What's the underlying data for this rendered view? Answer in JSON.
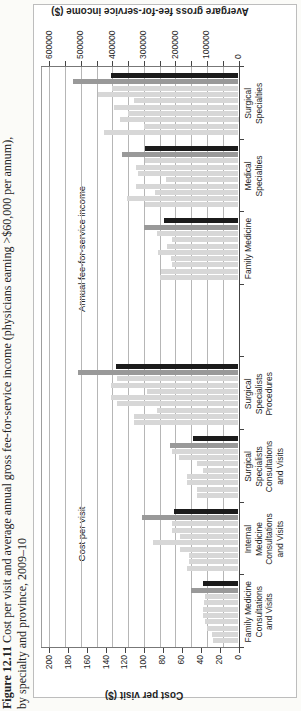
{
  "caption": {
    "figure_label": "Figure 12.11",
    "line1": "Cost per visit and average annual gross fee-for-service income (physicians earning >$60,000 per annum),",
    "line2": "by specialty and province, 2009–10"
  },
  "chart_data": {
    "type": "bar",
    "title": "",
    "rotation_note": "figure printed sideways: entire chart rotated 90° counter-clockwise on the portrait page",
    "left_axis": {
      "title": "Cost per visit ($)",
      "min": 0,
      "max": 200,
      "tick_step": 20,
      "tick_labels": [
        "0",
        "20",
        "40",
        "60",
        "80",
        "100",
        "120",
        "140",
        "160",
        "180",
        "200"
      ]
    },
    "right_axis": {
      "title": "Avergare gross fee-for-service income ($)",
      "min": 0,
      "max": 600000,
      "tick_step": 100000,
      "minor_tick_step": 50000,
      "tick_labels": [
        "0",
        "100000",
        "200000",
        "300000",
        "400000",
        "500000",
        "600000"
      ]
    },
    "section_labels": {
      "cost": "Cost per visit",
      "income": "Annual fee-for-service income"
    },
    "bar_colors": {
      "light": "#d7d7d7",
      "gray": "#999999",
      "black": "#1b1b1b"
    },
    "legend": "none (10 unlabeled province bars per specialty: 8 light gray, 1 medium gray, 1 black)",
    "grid": "horizontal gridlines every 50000 on income axis, spanning full plot",
    "groups": [
      {
        "category_lines": [
          "Family Medicine",
          "Consultations",
          "and Visits"
        ],
        "axis": "left",
        "values": [
          27,
          28,
          33,
          35,
          38,
          38,
          36,
          35,
          50,
          38
        ],
        "colors": [
          "light",
          "light",
          "light",
          "light",
          "light",
          "light",
          "light",
          "light",
          "gray",
          "black"
        ]
      },
      {
        "category_lines": [
          "Internal",
          "Medicine",
          "Consultations",
          "and Visits"
        ],
        "axis": "left",
        "values": [
          54,
          52,
          52,
          62,
          90,
          62,
          70,
          70,
          102,
          68
        ],
        "colors": [
          "light",
          "light",
          "light",
          "light",
          "light",
          "light",
          "light",
          "light",
          "gray",
          "black"
        ]
      },
      {
        "category_lines": [
          "Surgical",
          "Specialists",
          "Consultations",
          "and Visits"
        ],
        "axis": "left",
        "values": [
          44,
          44,
          54,
          54,
          38,
          44,
          63,
          70,
          72,
          48
        ],
        "colors": [
          "light",
          "light",
          "light",
          "light",
          "light",
          "light",
          "light",
          "light",
          "gray",
          "black"
        ]
      },
      {
        "category_lines": [
          "Surgical",
          "Specialists",
          "Procedures"
        ],
        "axis": "left",
        "values": [
          110,
          110,
          86,
          128,
          135,
          97,
          135,
          128,
          170,
          130
        ],
        "colors": [
          "light",
          "light",
          "light",
          "light",
          "light",
          "light",
          "light",
          "light",
          "gray",
          "black"
        ]
      },
      {
        "category_lines": [],
        "axis": null,
        "values": [],
        "colors": []
      },
      {
        "category_lines": [
          "Family Medicine"
        ],
        "axis": "right",
        "values": [
          250000,
          245000,
          210000,
          215000,
          255000,
          228000,
          212000,
          260000,
          300000,
          235000
        ],
        "colors": [
          "light",
          "light",
          "light",
          "light",
          "light",
          "light",
          "light",
          "light",
          "gray",
          "black"
        ]
      },
      {
        "category_lines": [
          "Medical",
          "Specialties"
        ],
        "axis": "right",
        "values": [
          295000,
          355000,
          265000,
          325000,
          230000,
          320000,
          325000,
          295000,
          370000,
          295000
        ],
        "colors": [
          "light",
          "light",
          "light",
          "light",
          "light",
          "light",
          "light",
          "light",
          "gray",
          "black"
        ]
      },
      {
        "category_lines": [
          "Surgical",
          "Specialties"
        ],
        "axis": "right",
        "values": [
          425000,
          300000,
          375000,
          350000,
          395000,
          330000,
          445000,
          400000,
          525000,
          405000
        ],
        "colors": [
          "light",
          "light",
          "light",
          "light",
          "light",
          "light",
          "light",
          "light",
          "gray",
          "black"
        ]
      }
    ]
  }
}
